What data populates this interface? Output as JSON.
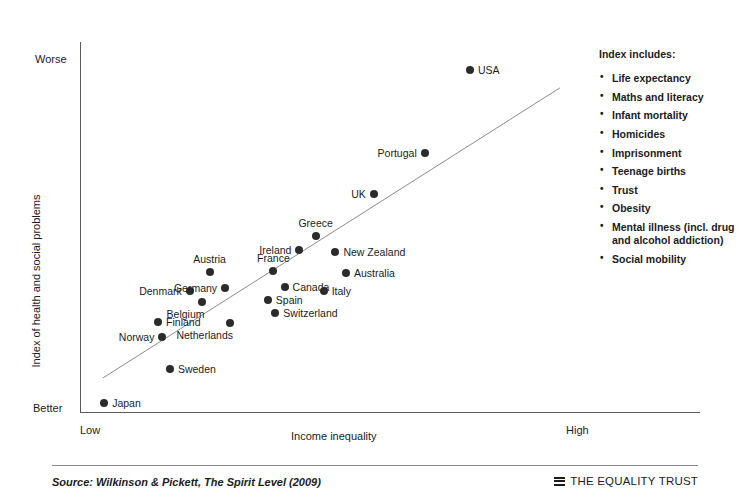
{
  "chart_data": {
    "type": "scatter",
    "title": "",
    "xlabel": "Income inequality",
    "ylabel": "Index of health and social problems",
    "x_tick_labels": [
      "Low",
      "High"
    ],
    "y_tick_labels": [
      "Worse",
      "Better"
    ],
    "xlim": [
      0,
      1
    ],
    "ylim": [
      0,
      1
    ],
    "grid": false,
    "legend_position": "right",
    "trendline": {
      "x0": 0.037,
      "y0": 0.092,
      "x1": 0.774,
      "y1": 0.876
    },
    "points": [
      {
        "label": "Japan",
        "x": 0.039,
        "y": 0.024,
        "label_side": "right"
      },
      {
        "label": "Sweden",
        "x": 0.145,
        "y": 0.115,
        "label_side": "right"
      },
      {
        "label": "Norway",
        "x": 0.133,
        "y": 0.203,
        "label_side": "left"
      },
      {
        "label": "Finland",
        "x": 0.126,
        "y": 0.243,
        "label_side": "right"
      },
      {
        "label": "Netherlands",
        "x": 0.242,
        "y": 0.24,
        "label_side": "below-left"
      },
      {
        "label": "Belgium",
        "x": 0.196,
        "y": 0.297,
        "label_side": "below-left"
      },
      {
        "label": "Denmark",
        "x": 0.177,
        "y": 0.327,
        "label_side": "left"
      },
      {
        "label": "Switzerland",
        "x": 0.315,
        "y": 0.268,
        "label_side": "right"
      },
      {
        "label": "Spain",
        "x": 0.303,
        "y": 0.304,
        "label_side": "right"
      },
      {
        "label": "Germany",
        "x": 0.234,
        "y": 0.335,
        "label_side": "left"
      },
      {
        "label": "Austria",
        "x": 0.209,
        "y": 0.378,
        "label_side": "above"
      },
      {
        "label": "Canada",
        "x": 0.33,
        "y": 0.338,
        "label_side": "right"
      },
      {
        "label": "Italy",
        "x": 0.393,
        "y": 0.327,
        "label_side": "right"
      },
      {
        "label": "France",
        "x": 0.312,
        "y": 0.381,
        "label_side": "above"
      },
      {
        "label": "Australia",
        "x": 0.429,
        "y": 0.376,
        "label_side": "right"
      },
      {
        "label": "Ireland",
        "x": 0.354,
        "y": 0.437,
        "label_side": "left"
      },
      {
        "label": "New Zealand",
        "x": 0.412,
        "y": 0.432,
        "label_side": "right"
      },
      {
        "label": "Greece",
        "x": 0.38,
        "y": 0.475,
        "label_side": "above"
      },
      {
        "label": "UK",
        "x": 0.474,
        "y": 0.589,
        "label_side": "left"
      },
      {
        "label": "Portugal",
        "x": 0.556,
        "y": 0.7,
        "label_side": "left"
      },
      {
        "label": "USA",
        "x": 0.629,
        "y": 0.925,
        "label_side": "right"
      }
    ]
  },
  "index_panel": {
    "heading": "Index includes:",
    "items": [
      "Life expectancy",
      "Maths and literacy",
      "Infant mortality",
      "Homicides",
      "Imprisonment",
      "Teenage births",
      "Trust",
      "Obesity",
      "Mental illness (incl. drug and alcohol addiction)",
      "Social mobility"
    ]
  },
  "footer": {
    "source": "Source: Wilkinson & Pickett, The Spirit Level (2009)",
    "brand_name": "THE EQUALITY TRUST",
    "brand_mark": "three-bars-logo"
  },
  "colors": {
    "point": "#2b2b2b",
    "axis": "#5b5b5b",
    "text": "#1c1c1c",
    "rule": "#8a8a8a",
    "background": "#ffffff"
  }
}
